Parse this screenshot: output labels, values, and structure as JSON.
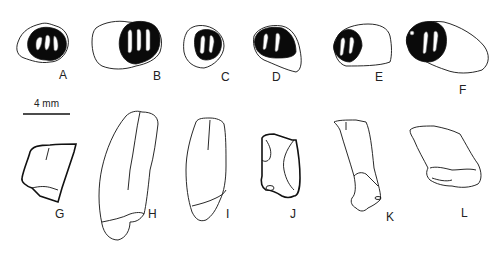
{
  "figure": {
    "scale_bar": {
      "label": "4 mm"
    },
    "panels": [
      {
        "id": "A",
        "label": "A",
        "view": "occlusal"
      },
      {
        "id": "B",
        "label": "B",
        "view": "occlusal"
      },
      {
        "id": "C",
        "label": "C",
        "view": "occlusal"
      },
      {
        "id": "D",
        "label": "D",
        "view": "occlusal"
      },
      {
        "id": "E",
        "label": "E",
        "view": "occlusal"
      },
      {
        "id": "F",
        "label": "F",
        "view": "occlusal"
      },
      {
        "id": "G",
        "label": "G",
        "view": "lateral"
      },
      {
        "id": "H",
        "label": "H",
        "view": "lateral"
      },
      {
        "id": "I",
        "label": "I",
        "view": "lateral"
      },
      {
        "id": "J",
        "label": "J",
        "view": "lateral"
      },
      {
        "id": "K",
        "label": "K",
        "view": "lateral"
      },
      {
        "id": "L",
        "label": "L",
        "view": "lateral"
      }
    ]
  }
}
